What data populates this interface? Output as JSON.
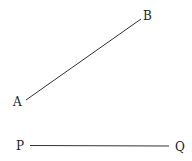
{
  "diagram": {
    "segments": [
      {
        "name": "AB",
        "start": {
          "label": "A"
        },
        "end": {
          "label": "B"
        }
      },
      {
        "name": "PQ",
        "start": {
          "label": "P"
        },
        "end": {
          "label": "Q"
        }
      }
    ]
  }
}
